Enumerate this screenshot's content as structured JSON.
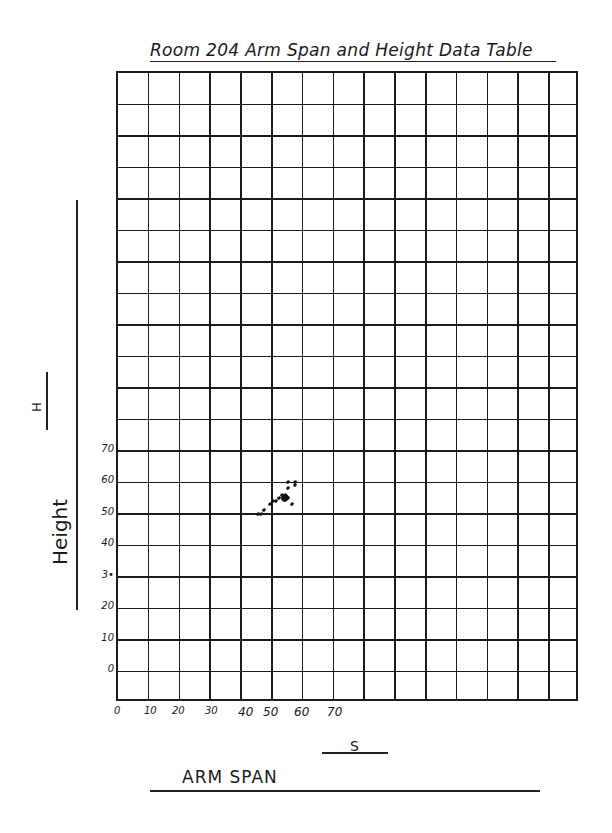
{
  "header": {
    "title": "Room 204 Arm Span and Height Data Table"
  },
  "axes": {
    "y_label": "Height",
    "y_symbol": "H",
    "x_label": "ARM SPAN",
    "x_symbol": "S",
    "y_ticks": [
      "70",
      "60",
      "50",
      "40",
      "3•",
      "20",
      "10",
      "0"
    ],
    "x_ticks": [
      "0",
      "10",
      "20",
      "30",
      "40",
      "50",
      "60",
      "70"
    ]
  },
  "grid": {
    "columns": 15,
    "rows": 20
  },
  "chart_data": {
    "type": "scatter",
    "title": "Room 204 Arm Span and Height Data Table",
    "xlabel": "ARM SPAN (S)",
    "ylabel": "Height (H)",
    "xlim": [
      0,
      148
    ],
    "ylim": [
      -10,
      190
    ],
    "x_ticks": [
      0,
      10,
      20,
      30,
      40,
      50,
      60,
      70
    ],
    "y_ticks": [
      0,
      10,
      20,
      30,
      40,
      50,
      60,
      70
    ],
    "grid": true,
    "legend": null,
    "series": [
      {
        "name": "students",
        "points": [
          {
            "x": 46,
            "y": 50
          },
          {
            "x": 47,
            "y": 50
          },
          {
            "x": 48,
            "y": 51
          },
          {
            "x": 50,
            "y": 53
          },
          {
            "x": 51,
            "y": 54
          },
          {
            "x": 52,
            "y": 54
          },
          {
            "x": 53,
            "y": 55
          },
          {
            "x": 54,
            "y": 56
          },
          {
            "x": 55,
            "y": 56
          },
          {
            "x": 55,
            "y": 55
          },
          {
            "x": 56,
            "y": 55
          },
          {
            "x": 56,
            "y": 58
          },
          {
            "x": 57,
            "y": 53
          },
          {
            "x": 58,
            "y": 59
          },
          {
            "x": 58,
            "y": 60
          },
          {
            "x": 56,
            "y": 60
          }
        ]
      }
    ]
  }
}
